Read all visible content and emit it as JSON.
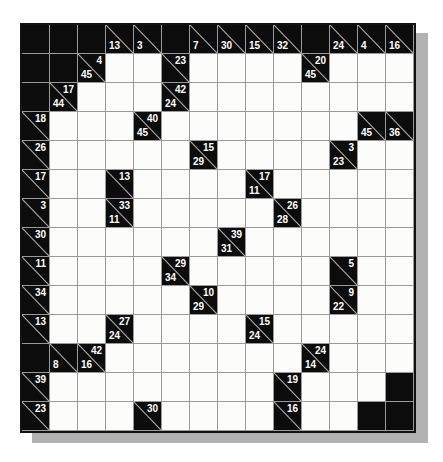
{
  "puzzle": {
    "type": "kakuro",
    "rows": 14,
    "cols": 14,
    "legend": {
      "black": "unused black cell",
      "clue": "black cell with diagonal; 'd' = down sum (bottom-left), 'a' = across sum (top-right)",
      "white": "empty entry cell"
    },
    "colors": {
      "page_bg": "#fefefe",
      "black_cell": "#0c0c0c",
      "white_cell": "#fcfcfb",
      "grid_line": "#9a9a9a",
      "outer_border": "#111111",
      "diagonal_line": "#aaaaaa",
      "clue_text": "#ffffff",
      "shadow": "#b1b1b1"
    },
    "grid": [
      [
        "#",
        "#",
        "#",
        {
          "d": 13
        },
        {
          "d": 3
        },
        "#",
        {
          "d": 7
        },
        {
          "d": 30
        },
        {
          "d": 15
        },
        {
          "d": 32
        },
        "#",
        {
          "d": 24
        },
        {
          "d": 4
        },
        {
          "d": 16
        }
      ],
      [
        "#",
        "#",
        {
          "d": 45,
          "a": 4
        },
        ".",
        ".",
        {
          "a": 23
        },
        ".",
        ".",
        ".",
        ".",
        {
          "d": 45,
          "a": 20
        },
        ".",
        ".",
        "."
      ],
      [
        "#",
        {
          "d": 44,
          "a": 17
        },
        ".",
        ".",
        ".",
        {
          "d": 24,
          "a": 42
        },
        ".",
        ".",
        ".",
        ".",
        ".",
        ".",
        ".",
        "."
      ],
      [
        {
          "a": 18
        },
        ".",
        ".",
        ".",
        {
          "d": 45,
          "a": 40
        },
        ".",
        ".",
        ".",
        ".",
        ".",
        ".",
        ".",
        {
          "d": 45
        },
        {
          "d": 36
        }
      ],
      [
        {
          "a": 26
        },
        ".",
        ".",
        ".",
        ".",
        ".",
        {
          "d": 29,
          "a": 15
        },
        ".",
        ".",
        ".",
        ".",
        {
          "d": 23,
          "a": 3
        },
        ".",
        "."
      ],
      [
        {
          "a": 17
        },
        ".",
        ".",
        {
          "a": 13
        },
        ".",
        ".",
        ".",
        ".",
        {
          "d": 11,
          "a": 17
        },
        ".",
        ".",
        ".",
        ".",
        "."
      ],
      [
        {
          "a": 3
        },
        ".",
        ".",
        {
          "d": 11,
          "a": 33
        },
        ".",
        ".",
        ".",
        ".",
        ".",
        {
          "d": 28,
          "a": 26
        },
        ".",
        ".",
        ".",
        "."
      ],
      [
        {
          "a": 30
        },
        ".",
        ".",
        ".",
        ".",
        ".",
        ".",
        {
          "d": 31,
          "a": 39
        },
        ".",
        ".",
        ".",
        ".",
        ".",
        "."
      ],
      [
        {
          "a": 11
        },
        ".",
        ".",
        ".",
        ".",
        {
          "d": 34,
          "a": 29
        },
        ".",
        ".",
        ".",
        ".",
        ".",
        {
          "a": 5
        },
        ".",
        "."
      ],
      [
        {
          "a": 34
        },
        ".",
        ".",
        ".",
        ".",
        ".",
        {
          "d": 29,
          "a": 10
        },
        ".",
        ".",
        ".",
        ".",
        {
          "d": 22,
          "a": 9
        },
        ".",
        "."
      ],
      [
        {
          "a": 13
        },
        ".",
        ".",
        {
          "d": 24,
          "a": 27
        },
        ".",
        ".",
        ".",
        ".",
        {
          "d": 24,
          "a": 15
        },
        ".",
        ".",
        ".",
        ".",
        "."
      ],
      [
        "#",
        {
          "d": 8
        },
        {
          "d": 16,
          "a": 42
        },
        ".",
        ".",
        ".",
        ".",
        ".",
        ".",
        ".",
        {
          "d": 14,
          "a": 24
        },
        ".",
        ".",
        "."
      ],
      [
        {
          "a": 39
        },
        ".",
        ".",
        ".",
        ".",
        ".",
        ".",
        ".",
        ".",
        {
          "a": 19
        },
        ".",
        ".",
        ".",
        "#"
      ],
      [
        {
          "a": 23
        },
        ".",
        ".",
        ".",
        {
          "a": 30
        },
        ".",
        ".",
        ".",
        ".",
        {
          "a": 16
        },
        ".",
        ".",
        "#",
        "#"
      ]
    ]
  }
}
